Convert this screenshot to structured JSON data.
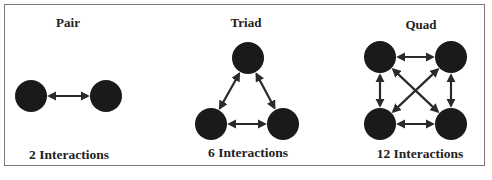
{
  "panels": [
    {
      "title": "Pair",
      "count_label": "2 Interactions",
      "nodes": [
        [
          31,
          96
        ],
        [
          106,
          96
        ]
      ],
      "edges": [
        [
          0,
          1
        ]
      ]
    },
    {
      "title": "Triad",
      "count_label": "6 Interactions",
      "nodes": [
        [
          248,
          58
        ],
        [
          211,
          124
        ],
        [
          283,
          124
        ]
      ],
      "edges": [
        [
          0,
          1
        ],
        [
          0,
          2
        ],
        [
          1,
          2
        ]
      ]
    },
    {
      "title": "Quad",
      "count_label": "12 Interactions",
      "nodes": [
        [
          380,
          57
        ],
        [
          451,
          57
        ],
        [
          380,
          124
        ],
        [
          451,
          124
        ]
      ],
      "edges": [
        [
          0,
          1
        ],
        [
          2,
          3
        ],
        [
          0,
          2
        ],
        [
          1,
          3
        ],
        [
          0,
          3
        ],
        [
          1,
          2
        ]
      ]
    }
  ],
  "style": {
    "node_color": "#1a1a1a",
    "edge_color": "#2a2a2a",
    "border_color": "#7a7a7a",
    "node_radius": 16
  }
}
